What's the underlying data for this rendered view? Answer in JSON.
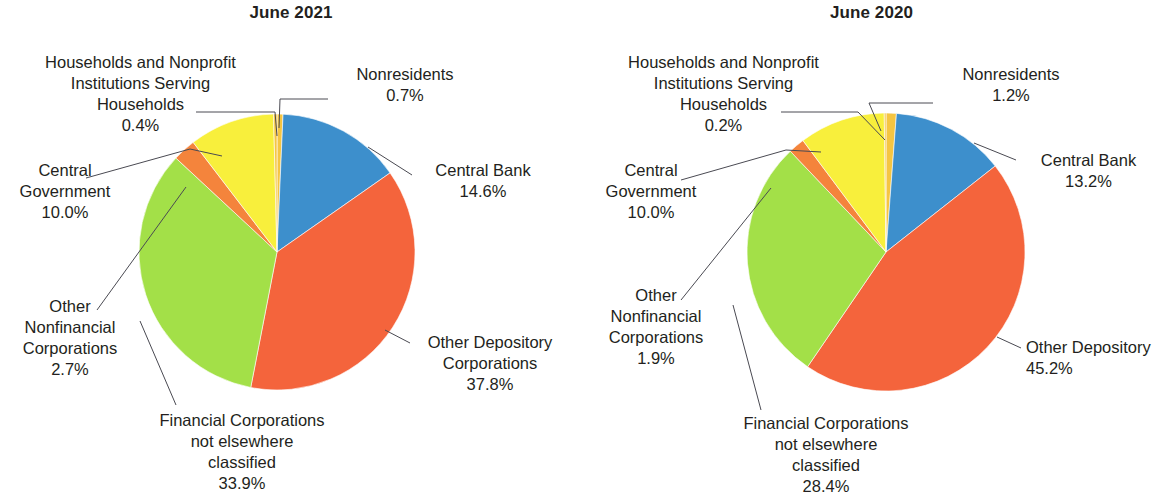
{
  "chart_data": [
    {
      "type": "pie",
      "title": "June 2021",
      "categories": [
        "Nonresidents",
        "Central Bank",
        "Other Depository Corporations",
        "Financial Corporations not elsewhere classified",
        "Other Nonfinancial Corporations",
        "Central Government",
        "Households and Nonprofit Institutions Serving Households"
      ],
      "values": [
        0.7,
        14.6,
        37.8,
        33.9,
        2.7,
        10.0,
        0.4
      ],
      "value_labels": [
        "0.7%",
        "14.6%",
        "37.8%",
        "33.9%",
        "2.7%",
        "10.0%",
        "0.4%"
      ],
      "colors": [
        "#f3c34a",
        "#3b8fcd",
        "#f4643c",
        "#9fe04a",
        "#f4843c",
        "#fbe game",
        "#f7ef3a"
      ],
      "legend": "none",
      "xlabel": "",
      "ylabel": ""
    },
    {
      "type": "pie",
      "title": "June 2020",
      "categories": [
        "Nonresidents",
        "Central Bank",
        "Other Depository Corporations",
        "Financial Corporations not elsewhere classified",
        "Other Nonfinancial Corporations",
        "Central Government",
        "Households and Nonprofit Institutions Serving Households"
      ],
      "values": [
        1.2,
        13.2,
        45.2,
        28.4,
        1.9,
        10.0,
        0.2
      ],
      "value_labels": [
        "1.2%",
        "13.2%",
        "45.2%",
        "28.4%",
        "1.9%",
        "10.0%",
        "0.2%"
      ],
      "legend": "none",
      "xlabel": "",
      "ylabel": ""
    }
  ],
  "palette": {
    "nonresidents": "#f5c542",
    "central_bank": "#3d8fcc",
    "other_depository": "#f4643c",
    "financial_nec": "#a3e048",
    "other_nonfinancial": "#f4843c",
    "central_government": "#f8ef3c",
    "households": "#f5c542",
    "leader_line": "#4a4a52",
    "text": "#231f20"
  },
  "left": {
    "title": "June 2021",
    "labels": {
      "households": "Households and Nonprofit\nInstitutions Serving\nHouseholds\n0.4%",
      "central_government": "Central\nGovernment\n10.0%",
      "other_nonfinancial": "Other\nNonfinancial\nCorporations\n2.7%",
      "financial_nec": "Financial Corporations\nnot elsewhere\nclassified\n33.9%",
      "nonresidents": "Nonresidents\n0.7%",
      "central_bank": "Central Bank\n14.6%",
      "other_depository": "Other Depository\nCorporations\n37.8%"
    }
  },
  "right": {
    "title": "June 2020",
    "labels": {
      "households": "Households and Nonprofit\nInstitutions Serving\nHouseholds\n0.2%",
      "central_government": "Central\nGovernment\n10.0%",
      "other_nonfinancial": "Other\nNonfinancial\nCorporations\n1.9%",
      "financial_nec": "Financial Corporations\nnot elsewhere\nclassified\n28.4%",
      "nonresidents": "Nonresidents\n1.2%",
      "central_bank": "Central Bank\n13.2%",
      "other_depository": "Other Depository\n45.2%"
    }
  }
}
